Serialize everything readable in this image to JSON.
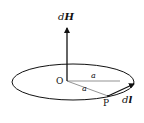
{
  "diagram": {
    "labels": {
      "dH_prefix": "d",
      "dH_vector": "H",
      "origin": "O",
      "radius_top": "a",
      "radius_bottom": "a",
      "point": "P",
      "dl_prefix": "d",
      "dl_vector": "l"
    },
    "colors": {
      "stroke": "#111111",
      "thin_line": "#555555",
      "background": "#ffffff"
    }
  }
}
